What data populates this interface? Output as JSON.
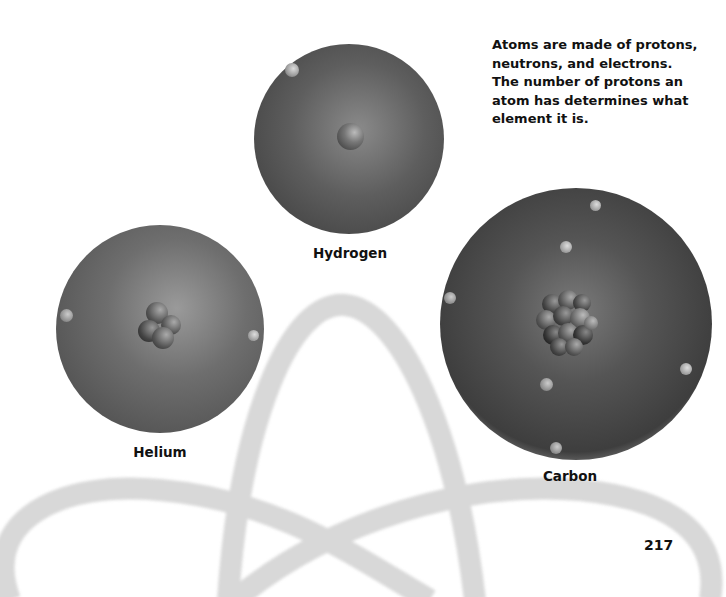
{
  "caption": "Atoms are made of protons, neutrons, and electrons. The number of protons an atom has determines what element it is.",
  "atoms": [
    {
      "name": "Hydrogen",
      "nucleus_particles": 1,
      "electrons": 1
    },
    {
      "name": "Helium",
      "nucleus_particles": 4,
      "electrons": 2
    },
    {
      "name": "Carbon",
      "nucleus_particles": 12,
      "electrons": 6
    }
  ],
  "page_number": "217",
  "colors": {
    "cloud_dark": "#3a3a3a",
    "cloud_mid": "#6a6a6a",
    "orbit": "#d8d8d8",
    "text": "#111111"
  }
}
